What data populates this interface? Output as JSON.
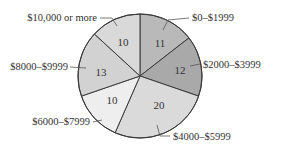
{
  "chart_data": {
    "type": "pie",
    "title": "",
    "start_angle": "top",
    "direction": "clockwise",
    "total": 76,
    "slices": [
      {
        "label": "$0–$1999",
        "value": 11,
        "color": "#b9b9b9"
      },
      {
        "label": "$2000–$3999",
        "value": 12,
        "color": "#a9a9a9"
      },
      {
        "label": "$4000–$5999",
        "value": 20,
        "color": "#dadada"
      },
      {
        "label": "$6000–$7999",
        "value": 10,
        "color": "#eeeeee"
      },
      {
        "label": "$8000–$9999",
        "value": 13,
        "color": "#d2d2d2"
      },
      {
        "label": "$10,000 or more",
        "value": 10,
        "color": "#d9d9d9"
      }
    ]
  },
  "layout": {
    "cx": 140,
    "cy": 76,
    "r": 62,
    "labels": [
      {
        "text_x": 192,
        "text_y": 21,
        "anchor": "start",
        "leader": [
          [
            163,
            30
          ],
          [
            168,
            20
          ],
          [
            189,
            18
          ]
        ],
        "value_pos": [
          160,
          47
        ]
      },
      {
        "text_x": 203,
        "text_y": 68,
        "anchor": "start",
        "leader": [
          [
            190,
            66
          ],
          [
            200,
            64
          ]
        ],
        "value_pos": [
          180,
          74
        ]
      },
      {
        "text_x": 173,
        "text_y": 140,
        "anchor": "start",
        "leader": [
          [
            157,
            125
          ],
          [
            160,
            136
          ],
          [
            170,
            136
          ]
        ],
        "value_pos": [
          159,
          109
        ]
      },
      {
        "text_x": 90,
        "text_y": 125,
        "anchor": "end",
        "leader": [
          [
            93,
            122
          ],
          [
            102,
            120
          ]
        ],
        "value_pos": [
          112,
          104
        ]
      },
      {
        "text_x": 68,
        "text_y": 70,
        "anchor": "end",
        "leader": [
          [
            70,
            67
          ],
          [
            86,
            68
          ]
        ],
        "value_pos": [
          101,
          76
        ]
      },
      {
        "text_x": 97,
        "text_y": 21,
        "anchor": "end",
        "leader": [
          [
            100,
            18
          ],
          [
            112,
            18
          ],
          [
            117,
            26
          ]
        ],
        "value_pos": [
          123,
          46
        ]
      }
    ]
  }
}
